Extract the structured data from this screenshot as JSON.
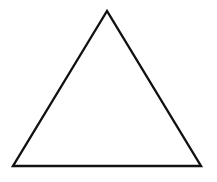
{
  "diagram": {
    "shape": "triangle",
    "kind": "equilateral",
    "vertices": {
      "apex": [
        107,
        11
      ],
      "bottom_left": [
        13,
        166
      ],
      "bottom_right": [
        201,
        166
      ]
    },
    "stroke_color": "#111111",
    "fill_color": "#ffffff",
    "background_color": "#ffffff",
    "stroke_width": 2.4
  }
}
